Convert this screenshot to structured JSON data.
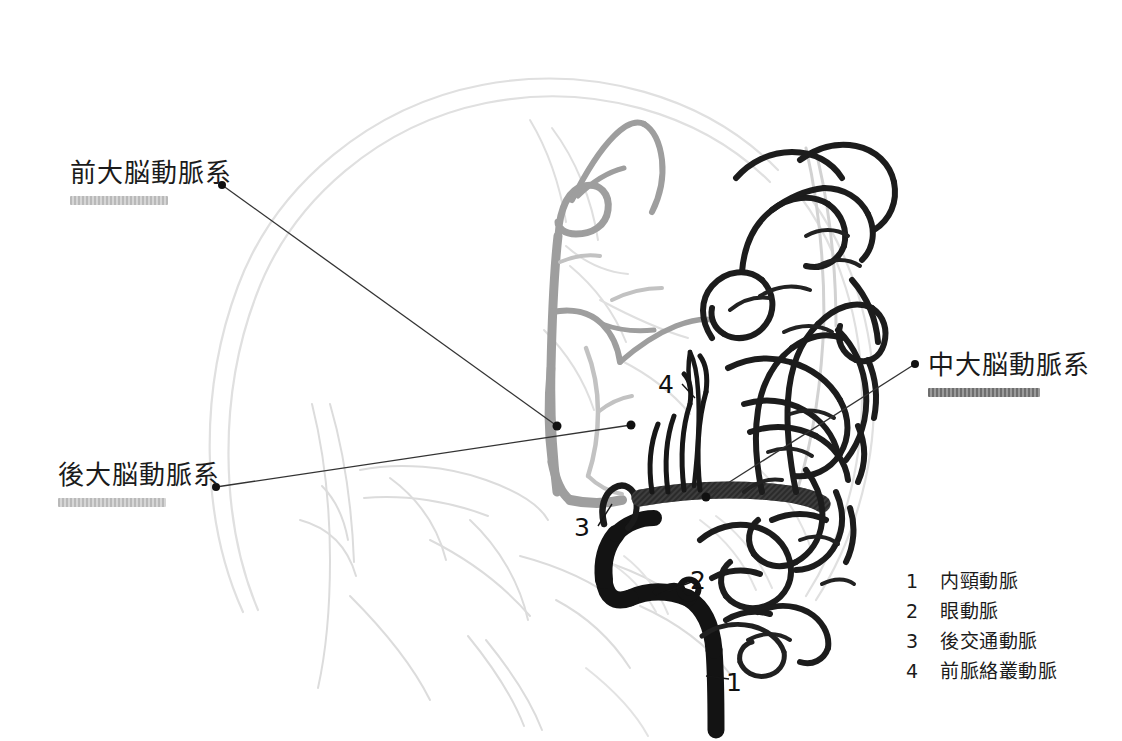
{
  "figure": {
    "type": "cerebral-angiogram-diagram",
    "view": "lateral internal carotid artery angiogram, schematic",
    "background_color": "#ffffff"
  },
  "callouts": [
    {
      "id": "aca",
      "label": "前大脳動脈系",
      "subtitle_redacted": true,
      "dot": {
        "x": 222,
        "y": 185
      },
      "target": {
        "x": 557,
        "y": 426
      }
    },
    {
      "id": "pca",
      "label": "後大脳動脈系",
      "subtitle_redacted": true,
      "dot": {
        "x": 216,
        "y": 487
      },
      "target": {
        "x": 631,
        "y": 425
      }
    },
    {
      "id": "mca",
      "label": "中大脳動脈系",
      "subtitle_redacted": true,
      "dot": {
        "x": 915,
        "y": 364
      },
      "target": {
        "x": 706,
        "y": 497
      }
    }
  ],
  "legend": {
    "items": [
      {
        "number": "1",
        "name": "内頸動脈"
      },
      {
        "number": "2",
        "name": "眼動脈"
      },
      {
        "number": "3",
        "name": "後交通動脈"
      },
      {
        "number": "4",
        "name": "前脈絡叢動脈"
      }
    ]
  },
  "markers": [
    {
      "number": "1",
      "x": 733,
      "y": 683,
      "leader_to": {
        "x": 706,
        "y": 676
      }
    },
    {
      "number": "2",
      "x": 698,
      "y": 580,
      "leader_to": {
        "x": 668,
        "y": 591
      }
    },
    {
      "number": "3",
      "x": 583,
      "y": 528,
      "leader_to": {
        "x": 611,
        "y": 505
      }
    },
    {
      "number": "4",
      "x": 666,
      "y": 385,
      "leader_to": {
        "x": 692,
        "y": 396
      }
    }
  ],
  "colors": {
    "ink_black": "#101010",
    "vessel_black": "#151515",
    "vessel_gray": "#9a9a9a",
    "vessel_light_gray": "#bdbdbd",
    "skull_faint": "#dddddd",
    "leader_line": "#333333",
    "redacted_bar": "#b9b9b9"
  }
}
